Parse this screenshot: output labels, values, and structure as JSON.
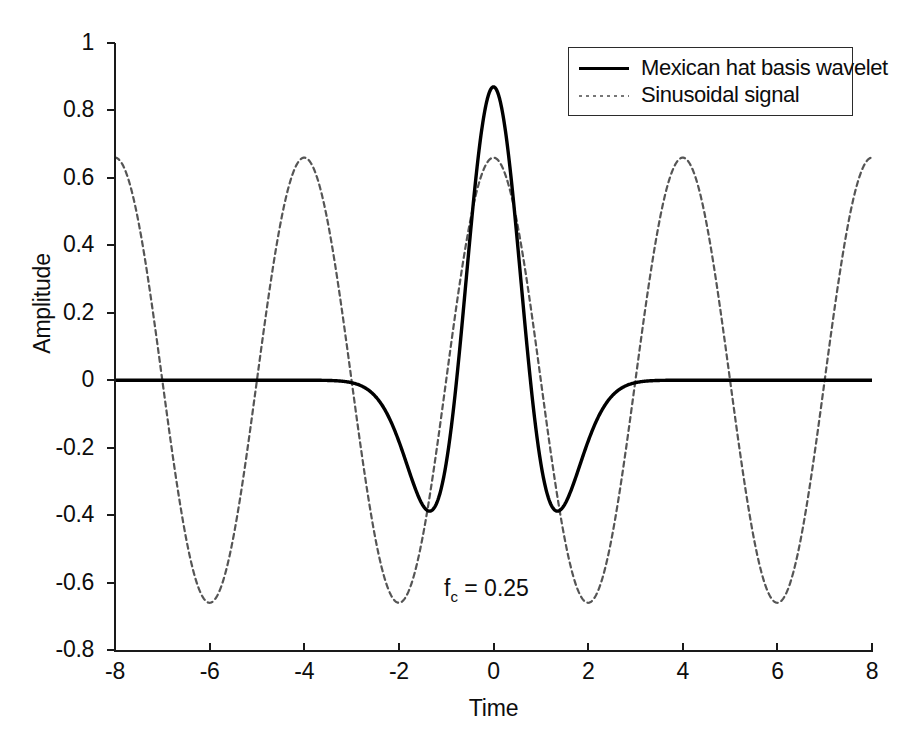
{
  "chart_data": {
    "type": "line",
    "title": "",
    "xlabel": "Time",
    "ylabel": "Amplitude",
    "xlim": [
      -8,
      8
    ],
    "ylim": [
      -0.8,
      1
    ],
    "xticks": [
      "-8",
      "-6",
      "-4",
      "-2",
      "0",
      "2",
      "4",
      "6",
      "8"
    ],
    "xtick_values": [
      -8,
      -6,
      -4,
      -2,
      0,
      2,
      4,
      6,
      8
    ],
    "yticks": [
      "1",
      "0.8",
      "0.6",
      "0.4",
      "0.2",
      "0",
      "-0.2",
      "-0.4",
      "-0.6",
      "-0.8"
    ],
    "ytick_values": [
      1,
      0.8,
      0.6,
      0.4,
      0.2,
      0,
      -0.2,
      -0.4,
      -0.6,
      -0.8
    ],
    "grid": false,
    "legend_position": "upper right",
    "annotations": [
      {
        "text_prefix": "f",
        "text_sub": "c",
        "text_suffix": " = 0.25",
        "x": -0.9,
        "y": -0.62
      }
    ],
    "series": [
      {
        "name": "Mexican hat basis wavelet",
        "style": "solid",
        "color": "#000000",
        "linewidth": 3,
        "formula": "mexican-hat wavelet, sigma=0.78, peak 0.87 at t=0, minima -0.39 at t=+/-1.8, zero outside |t|>4.3",
        "x": [
          -8,
          -7.5,
          -7,
          -6.5,
          -6,
          -5.5,
          -5,
          -4.8,
          -4.6,
          -4.4,
          -4.2,
          -4,
          -3.8,
          -3.6,
          -3.4,
          -3.2,
          -3,
          -2.8,
          -2.6,
          -2.4,
          -2.2,
          -2,
          -1.8,
          -1.6,
          -1.4,
          -1.2,
          -1,
          -0.8,
          -0.6,
          -0.4,
          -0.2,
          0,
          0.2,
          0.4,
          0.6,
          0.8,
          1,
          1.2,
          1.4,
          1.6,
          1.8,
          2,
          2.2,
          2.4,
          2.6,
          2.8,
          3,
          3.2,
          3.4,
          3.6,
          3.8,
          4,
          4.2,
          4.4,
          4.6,
          4.8,
          5,
          5.5,
          6,
          6.5,
          7,
          7.5,
          8
        ],
        "y": [
          0,
          0,
          0,
          0,
          0,
          0,
          0,
          -0.002,
          -0.005,
          -0.01,
          -0.018,
          -0.03,
          -0.047,
          -0.07,
          -0.1,
          -0.137,
          -0.18,
          -0.225,
          -0.27,
          -0.313,
          -0.35,
          -0.375,
          -0.39,
          -0.388,
          -0.365,
          -0.313,
          -0.225,
          -0.09,
          0.095,
          0.33,
          0.59,
          0.87,
          0.59,
          0.33,
          0.095,
          -0.09,
          -0.225,
          -0.313,
          -0.365,
          -0.388,
          -0.39,
          -0.375,
          -0.35,
          -0.313,
          -0.27,
          -0.225,
          -0.18,
          -0.137,
          -0.1,
          -0.07,
          -0.047,
          -0.03,
          -0.018,
          -0.01,
          -0.005,
          -0.002,
          0,
          0,
          0,
          0,
          0,
          0,
          0
        ]
      },
      {
        "name": "Sinusoidal signal",
        "style": "dotted",
        "color": "#555555",
        "linewidth": 1.6,
        "formula": "0.66 * cos(2*pi*0.25*t)",
        "amplitude": 0.66,
        "frequency": 0.25,
        "period": 4,
        "phase": "cosine (peaks at t = -8, -4, 0, 4, 8)"
      }
    ]
  },
  "axes": {
    "xlabel": "Time",
    "ylabel": "Amplitude"
  },
  "legend": {
    "entries": [
      {
        "label": "Mexican hat basis wavelet",
        "style": "solid"
      },
      {
        "label": "Sinusoidal signal",
        "style": "dotted"
      }
    ]
  },
  "annotation": {
    "prefix": "f",
    "subscript": "c",
    "suffix": " = 0.25"
  },
  "colors": {
    "wavelet": "#000000",
    "sinusoid": "#555555",
    "axis": "#1a1a1a",
    "background": "#ffffff"
  }
}
